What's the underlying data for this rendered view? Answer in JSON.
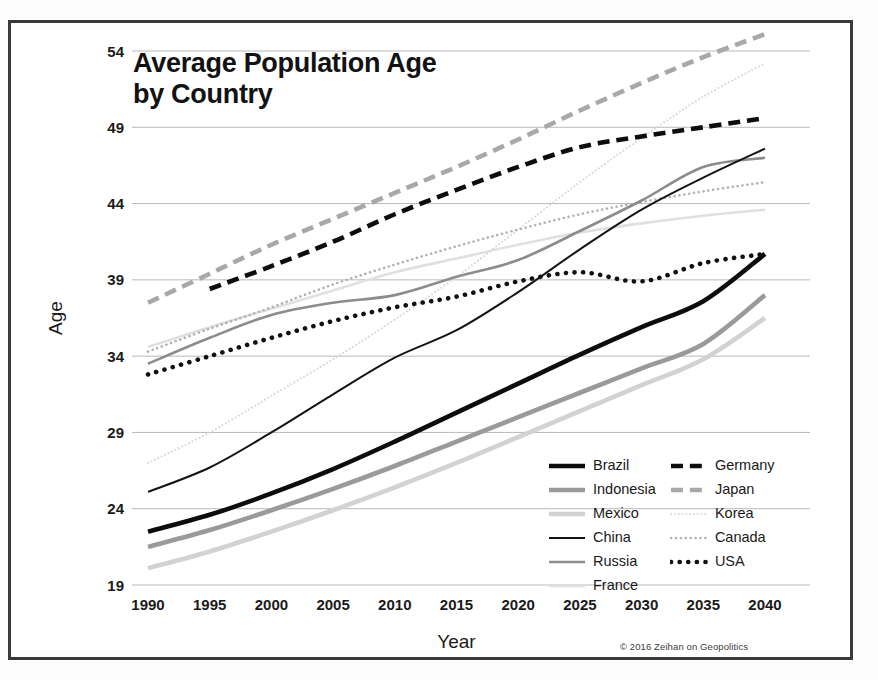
{
  "title": {
    "line1": "Average Population Age",
    "line2": "by Country",
    "full": "Average Population Age by Country"
  },
  "copyright": "© 2016 Zeihan on Geopolitics",
  "axes": {
    "x_title": "Year",
    "y_title": "Age"
  },
  "legend": {
    "column_left": [
      "Brazil",
      "Indonesia",
      "Mexico",
      "China",
      "Russia",
      "France"
    ],
    "column_right": [
      "Germany",
      "Japan",
      "Korea",
      "Canada",
      "USA"
    ]
  },
  "chart_data": {
    "type": "line",
    "title": "Average Population Age by Country",
    "xlabel": "Year",
    "ylabel": "Age",
    "x": [
      1990,
      1995,
      2000,
      2005,
      2010,
      2015,
      2020,
      2025,
      2030,
      2035,
      2040
    ],
    "xlim": [
      1990,
      2040
    ],
    "ylim": [
      19,
      54
    ],
    "yticks": [
      19,
      24,
      29,
      34,
      39,
      44,
      49,
      54
    ],
    "xticks": [
      1990,
      1995,
      2000,
      2005,
      2010,
      2015,
      2020,
      2025,
      2030,
      2035,
      2040
    ],
    "grid": "horizontal",
    "legend_position": "inside-bottom-right",
    "series": [
      {
        "name": "Brazil",
        "style": "solid",
        "width": "thick",
        "color": "#0d0d0d",
        "values": [
          22.5,
          23.6,
          25.0,
          26.6,
          28.4,
          30.3,
          32.2,
          34.1,
          35.9,
          37.6,
          40.7
        ]
      },
      {
        "name": "Indonesia",
        "style": "solid",
        "width": "thick",
        "color": "#9a9a9a",
        "values": [
          21.5,
          22.6,
          23.9,
          25.3,
          26.8,
          28.4,
          30.0,
          31.6,
          33.2,
          34.8,
          38.0
        ]
      },
      {
        "name": "Mexico",
        "style": "solid",
        "width": "thick",
        "color": "#d2d2d2",
        "values": [
          20.1,
          21.2,
          22.5,
          23.9,
          25.4,
          27.0,
          28.7,
          30.4,
          32.1,
          33.8,
          36.5
        ]
      },
      {
        "name": "China",
        "style": "solid",
        "width": "thin",
        "color": "#141414",
        "values": [
          25.1,
          26.7,
          29.0,
          31.5,
          33.9,
          35.7,
          38.2,
          41.0,
          43.6,
          45.7,
          47.6
        ]
      },
      {
        "name": "Russia",
        "style": "solid",
        "width": "medium",
        "color": "#8c8c8c",
        "values": [
          33.5,
          35.2,
          36.7,
          37.5,
          38.0,
          39.2,
          40.3,
          42.2,
          44.2,
          46.4,
          47.0
        ]
      },
      {
        "name": "France",
        "style": "solid",
        "width": "medium",
        "color": "#e0e0e0",
        "values": [
          34.6,
          35.9,
          37.1,
          38.3,
          39.5,
          40.4,
          41.3,
          42.1,
          42.7,
          43.2,
          43.6
        ]
      },
      {
        "name": "Germany",
        "style": "dashed",
        "width": "thick",
        "color": "#0d0d0d",
        "values": [
          null,
          38.4,
          39.9,
          41.5,
          43.3,
          44.9,
          46.4,
          47.7,
          48.4,
          49.0,
          49.6
        ]
      },
      {
        "name": "Japan",
        "style": "dashed",
        "width": "thick",
        "color": "#a8a8a8",
        "values": [
          37.5,
          39.4,
          41.3,
          43.0,
          44.7,
          46.4,
          48.2,
          50.1,
          51.9,
          53.6,
          55.1
        ]
      },
      {
        "name": "Korea",
        "style": "dotted",
        "width": "thin",
        "color": "#d8d8d8",
        "values": [
          27.0,
          29.0,
          31.4,
          33.8,
          36.4,
          39.2,
          42.3,
          45.4,
          48.3,
          51.0,
          53.2
        ]
      },
      {
        "name": "Canada",
        "style": "dotted",
        "width": "medium",
        "color": "#b3b3b3",
        "values": [
          34.3,
          35.8,
          37.2,
          38.7,
          40.0,
          41.2,
          42.3,
          43.3,
          44.1,
          44.8,
          45.4
        ]
      },
      {
        "name": "USA",
        "style": "dotted",
        "width": "thick",
        "color": "#111111",
        "values": [
          32.8,
          34.0,
          35.2,
          36.3,
          37.2,
          37.9,
          38.9,
          39.5,
          38.9,
          40.1,
          40.7
        ]
      }
    ]
  }
}
